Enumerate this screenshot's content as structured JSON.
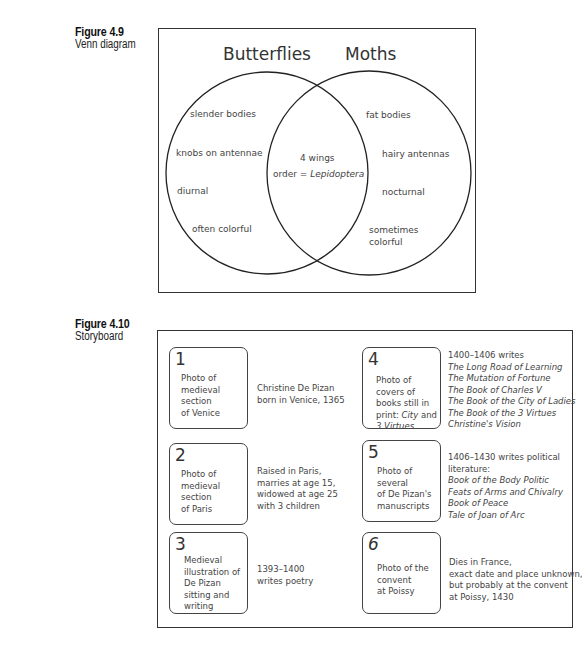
{
  "figures": [
    {
      "number": "Figure 4.9",
      "caption": "Venn diagram"
    },
    {
      "number": "Figure 4.10",
      "caption": "Storyboard"
    }
  ],
  "venn": {
    "left_title": "Butterflies",
    "right_title": "Moths",
    "left_items": [
      "slender bodies",
      "knobs on antennae",
      "diurnal",
      "often colorful"
    ],
    "right_items": [
      "fat bodies",
      "hairy antennas",
      "nocturnal",
      "sometimes",
      "colorful"
    ],
    "overlap_items": [
      "4 wings",
      "order = ",
      "Lepidoptera"
    ]
  },
  "storyboard": {
    "panels": [
      {
        "number": "1",
        "description": "Photo of\nmedieval\nsection\nof Venice",
        "text": [
          "Christine De Pizan",
          "born in Venice, 1365"
        ]
      },
      {
        "number": "2",
        "description": "Photo of\nmedieval\nsection\nof Paris",
        "text": [
          "Raised in Paris,",
          "marries at age 15,",
          "widowed at age 25",
          "with 3 children"
        ]
      },
      {
        "number": "3",
        "description": "Medieval\nillustration of\nDe Pizan\nsitting and\nwriting",
        "text": [
          "1393–1400",
          "writes poetry"
        ]
      },
      {
        "number": "4",
        "description_plain": "Photo of\ncovers of\nbooks still in\nprint: ",
        "description_italic_1": "City",
        "description_mid": " and",
        "description_italic_2": "3 Virtues",
        "text_intro": "1400–1406 writes",
        "titles": [
          "The Long Road of Learning",
          "The Mutation of Fortune",
          "The Book  of Charles V",
          "The Book of the City of Ladies",
          "The Book of the 3 Virtues",
          "Christine's Vision"
        ]
      },
      {
        "number": "5",
        "description": "Photo of\nseveral\nof De Pizan's\nmanuscripts",
        "text_intro": [
          "1406–1430 writes political",
          "literature:"
        ],
        "titles": [
          "Book of the Body Politic",
          "Feats of Arms and Chivalry",
          "Book of Peace",
          "Tale of Joan of Arc"
        ]
      },
      {
        "number": "6",
        "description": "Photo of the\nconvent\nat Poissy",
        "text": [
          "Dies in France,",
          "exact date and place unknown,",
          "but probably at the convent",
          "at Poissy, 1430"
        ]
      }
    ]
  }
}
